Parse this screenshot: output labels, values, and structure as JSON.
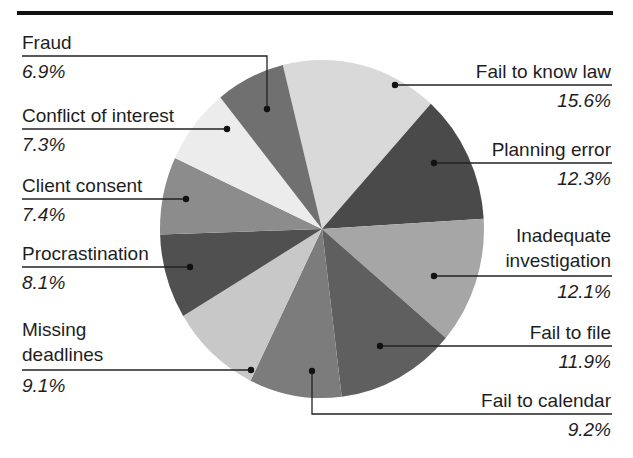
{
  "chart_data": {
    "type": "pie",
    "title": "",
    "start_angle_deg": -14,
    "direction": "clockwise",
    "legend_position": "leader-line labels around pie",
    "slices": [
      {
        "label": "Fail to know law",
        "value": 15.6,
        "pct_text": "15.6%",
        "color": "#d9d9d9",
        "side": "right"
      },
      {
        "label": "Planning error",
        "value": 12.3,
        "pct_text": "12.3%",
        "color": "#4a4a4a",
        "side": "right"
      },
      {
        "label": "Inadequate investigation",
        "value": 12.1,
        "pct_text": "12.1%",
        "color": "#a6a6a6",
        "side": "right"
      },
      {
        "label": "Fail to file",
        "value": 11.9,
        "pct_text": "11.9%",
        "color": "#5f5f5f",
        "side": "right"
      },
      {
        "label": "Fail to calendar",
        "value": 9.2,
        "pct_text": "9.2%",
        "color": "#7c7c7c",
        "side": "right"
      },
      {
        "label": "Missing deadlines",
        "value": 9.1,
        "pct_text": "9.1%",
        "color": "#c8c8c8",
        "side": "left"
      },
      {
        "label": "Procrastination",
        "value": 8.1,
        "pct_text": "8.1%",
        "color": "#505050",
        "side": "left"
      },
      {
        "label": "Client consent",
        "value": 7.4,
        "pct_text": "7.4%",
        "color": "#8c8c8c",
        "side": "left"
      },
      {
        "label": "Conflict of interest",
        "value": 7.3,
        "pct_text": "7.3%",
        "color": "#ececec",
        "side": "left"
      },
      {
        "label": "Fraud",
        "value": 6.9,
        "pct_text": "6.9%",
        "color": "#707070",
        "side": "left"
      }
    ]
  },
  "labels": {
    "fraud": {
      "line1": "Fraud",
      "pct": "6.9%"
    },
    "conflict": {
      "line1": "Conflict of interest",
      "pct": "7.3%"
    },
    "consent": {
      "line1": "Client consent",
      "pct": "7.4%"
    },
    "procrastination": {
      "line1": "Procrastination",
      "pct": "8.1%"
    },
    "missing": {
      "line1": "Missing",
      "line2": "deadlines",
      "pct": "9.1%"
    },
    "knowlaw": {
      "line1": "Fail to know law",
      "pct": "15.6%"
    },
    "planning": {
      "line1": "Planning error",
      "pct": "12.3%"
    },
    "investigation": {
      "line1": "Inadequate",
      "line2": "investigation",
      "pct": "12.1%"
    },
    "file": {
      "line1": "Fail to file",
      "pct": "11.9%"
    },
    "calendar": {
      "line1": "Fail to calendar",
      "pct": "9.2%"
    }
  }
}
